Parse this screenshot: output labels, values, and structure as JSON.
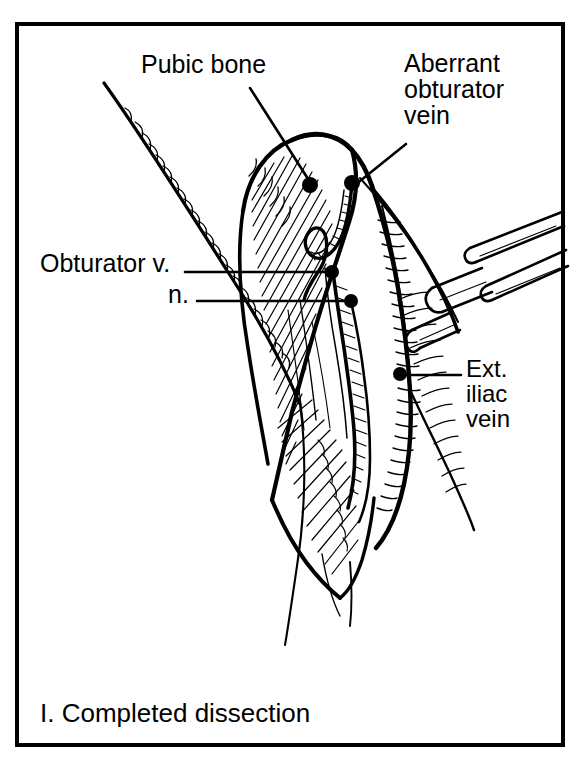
{
  "figure": {
    "caption": "I. Completed dissection",
    "caption_number": "I.",
    "caption_title": "Completed dissection",
    "frame": {
      "x": 15,
      "y": 22,
      "width": 549,
      "height": 724,
      "stroke_color": "#000000",
      "stroke_width": 4
    },
    "style": {
      "ink_color": "#000000",
      "paper_color": "#ffffff",
      "technique": "pen-and-ink line drawing with cross-hatching"
    }
  },
  "annotations": [
    {
      "id": "pubic-bone",
      "text": "Pubic bone",
      "lines": [
        "Pubic bone"
      ],
      "text_x": 141,
      "text_y": 51,
      "leader": {
        "from_x": 250,
        "from_y": 88,
        "to_x": 310,
        "to_y": 184
      },
      "marker": {
        "x": 310,
        "y": 185,
        "r": 8,
        "shape": "filled-dot"
      }
    },
    {
      "id": "aberrant-obturator-vein",
      "text": "Aberrant obturator vein",
      "lines": [
        "Aberrant",
        "obturator",
        "vein"
      ],
      "text_x": 404,
      "text_y": 50,
      "leader": {
        "from_x": 404,
        "from_y": 143,
        "to_x": 354,
        "to_y": 184
      },
      "marker": {
        "x": 352,
        "y": 183,
        "r": 8,
        "shape": "filled-dot"
      }
    },
    {
      "id": "obturator-vein",
      "text": "Obturator v.",
      "lines": [
        "Obturator v."
      ],
      "text_x": 40,
      "text_y": 250,
      "leader": {
        "from_x": 185,
        "from_y": 272,
        "to_x": 330,
        "to_y": 272
      },
      "marker": {
        "x": 332,
        "y": 272,
        "r": 7,
        "shape": "filled-dot"
      }
    },
    {
      "id": "obturator-nerve",
      "text": "n.",
      "lines": [
        "n."
      ],
      "text_x": 168,
      "text_y": 281,
      "leader": {
        "from_x": 196,
        "from_y": 301,
        "to_x": 349,
        "to_y": 301
      },
      "marker": {
        "x": 351,
        "y": 301,
        "r": 7,
        "shape": "filled-dot"
      }
    },
    {
      "id": "ext-iliac-vein",
      "text": "Ext. iliac vein",
      "lines": [
        "Ext.",
        "iliac",
        "vein"
      ],
      "text_x": 466,
      "text_y": 357,
      "leader": {
        "from_x": 460,
        "from_y": 375,
        "to_x": 404,
        "to_y": 375
      },
      "marker": {
        "x": 399,
        "y": 374,
        "r": 7,
        "shape": "filled-dot"
      }
    }
  ],
  "drawing_elements": [
    {
      "name": "inguinal-ligament",
      "description": "long curved line from upper-left running down to lower-centre with fine comb hatching on its lower edge"
    },
    {
      "name": "pubic-bone",
      "description": "large hatched dome-shaped bone mass in the centre upper area"
    },
    {
      "name": "wound-cavity",
      "description": "deep V-shaped dissected pelvic wound tapering to a point at the bottom"
    },
    {
      "name": "obturator-vessels",
      "description": "looping vessel bundle descending through the centre of the wound"
    },
    {
      "name": "external-iliac-vein",
      "description": "large shaded vessel along the right wall of the wound"
    },
    {
      "name": "retractor-instrument",
      "description": "forked surgical retractor entering from the upper right retracting tissue"
    }
  ]
}
